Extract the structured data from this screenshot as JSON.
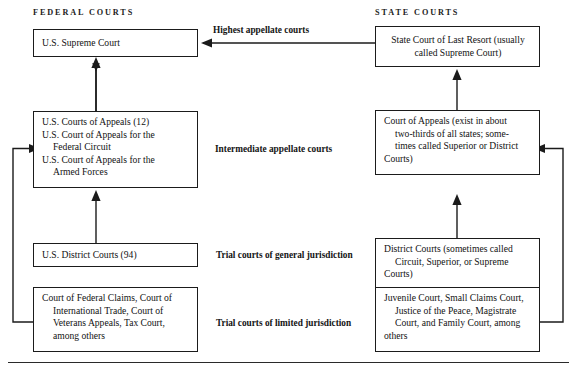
{
  "diagram": {
    "columns": [
      {
        "id": "federal",
        "label": "FEDERAL COURTS"
      },
      {
        "id": "state",
        "label": "STATE COURTS"
      }
    ],
    "tier_labels": [
      {
        "id": "highest",
        "label": "Highest appellate courts"
      },
      {
        "id": "intermediate",
        "label": "Intermediate appellate courts"
      },
      {
        "id": "general",
        "label": "Trial courts of general jurisdiction"
      },
      {
        "id": "limited",
        "label": "Trial courts of limited jurisdiction"
      }
    ],
    "nodes": {
      "federal_supreme": {
        "lines": [
          "U.S. Supreme Court"
        ]
      },
      "federal_appeals": {
        "lines": [
          "U.S. Courts of Appeals (12)",
          "U.S. Court of Appeals for the",
          "Federal Circuit",
          "U.S. Court of Appeals for the",
          "Armed Forces"
        ],
        "indents": [
          false,
          false,
          true,
          false,
          true
        ]
      },
      "federal_district": {
        "lines": [
          "U.S. District Courts (94)"
        ]
      },
      "federal_limited": {
        "lines": [
          "Court of Federal Claims, Court of",
          "International Trade, Court of",
          "Veterans Appeals, Tax Court,",
          "among others"
        ],
        "indents": [
          false,
          true,
          true,
          true
        ]
      },
      "state_last_resort": {
        "lines": [
          "State Court of Last Resort (usually",
          "called Supreme Court)"
        ]
      },
      "state_appeals": {
        "lines": [
          "Court of Appeals (exist in about",
          "two-thirds of all states; some-",
          "times called Superior or District",
          "Courts)"
        ],
        "indents": [
          false,
          true,
          true,
          false
        ]
      },
      "state_district": {
        "lines": [
          "District Courts (sometimes called",
          "Circuit, Superior, or Supreme",
          "Courts)"
        ],
        "indents": [
          false,
          true,
          false
        ]
      },
      "state_limited": {
        "lines": [
          "Juvenile Court, Small Claims Court,",
          "Justice of the Peace, Magistrate",
          "Court, and Family Court, among",
          "others"
        ],
        "indents": [
          false,
          true,
          true,
          false
        ]
      }
    },
    "edges": [
      {
        "id": "fed-appeals-to-supreme",
        "from": "federal_appeals",
        "to": "federal_supreme",
        "style": "arrow-up"
      },
      {
        "id": "fed-district-to-appeals",
        "from": "federal_district",
        "to": "federal_appeals",
        "style": "arrow-up"
      },
      {
        "id": "fed-limited-to-appeals",
        "from": "federal_limited",
        "to": "federal_appeals",
        "style": "arrow-left-wrap"
      },
      {
        "id": "state-last-resort-to-federal-supreme",
        "from": "state_last_resort",
        "to": "federal_supreme",
        "style": "arrow-left"
      },
      {
        "id": "state-appeals-to-last-resort",
        "from": "state_appeals",
        "to": "state_last_resort",
        "style": "arrow-up"
      },
      {
        "id": "state-district-to-appeals",
        "from": "state_district",
        "to": "state_appeals",
        "style": "arrow-up"
      },
      {
        "id": "state-limited-to-district",
        "from": "state_limited",
        "to": "state_district",
        "style": "arrow-up"
      },
      {
        "id": "state-limited-to-appeals",
        "from": "state_limited",
        "to": "state_appeals",
        "style": "arrow-right-wrap"
      }
    ],
    "colors": {
      "ink": "#1b1b1b",
      "background": "#ffffff",
      "rule": "#2a2a2a"
    }
  }
}
